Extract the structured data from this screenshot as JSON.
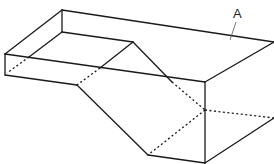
{
  "diagram": {
    "type": "isometric line drawing of a stepped block with a sloped cut",
    "labels": [
      {
        "id": "label-a",
        "text": "A",
        "x": 232,
        "y": 8
      }
    ],
    "colors": {
      "line": "#1a1a1a",
      "background": "#ffffff"
    }
  }
}
